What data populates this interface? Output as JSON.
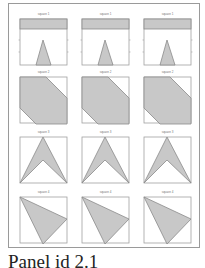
{
  "figure": {
    "columns": 3,
    "rows": [
      {
        "label": "square 1",
        "shape": "rect-top-with-triangle"
      },
      {
        "label": "square 2",
        "shape": "hexagon"
      },
      {
        "label": "square 3",
        "shape": "arrowhead"
      },
      {
        "label": "square 4",
        "shape": "triangle"
      }
    ],
    "colors": {
      "fill": "#c8c8c8",
      "shape_stroke": "#8a8a8a",
      "box_stroke": "#a0a0a0",
      "frame_stroke": "#9a9a9a"
    }
  },
  "caption": "Panel id 2.1"
}
